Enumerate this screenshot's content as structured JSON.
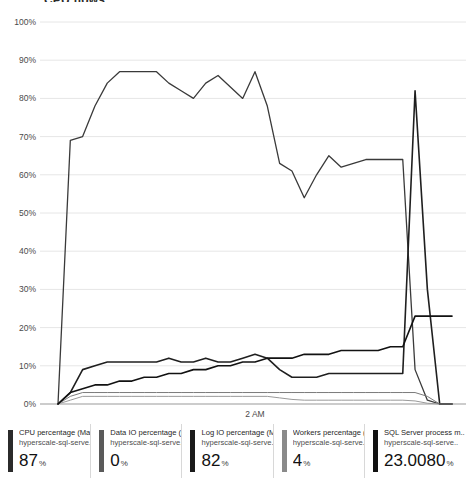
{
  "title": "CPU flows",
  "axis": {
    "yticks": [
      "100%",
      "90%",
      "80%",
      "70%",
      "60%",
      "50%",
      "40%",
      "30%",
      "20%",
      "10%",
      "0%"
    ],
    "xticks": [
      "2 AM"
    ]
  },
  "legend": {
    "items": [
      {
        "metric": "CPU percentage (Max)",
        "resource": "hyperscale-sql-serve..",
        "value": "87",
        "unit": "%",
        "color": "#2b2b2b"
      },
      {
        "metric": "Data IO percentage (..",
        "resource": "hyperscale-sql-serve..",
        "value": "0",
        "unit": "%",
        "color": "#5a5a5a"
      },
      {
        "metric": "Log IO percentage (Max)",
        "resource": "hyperscale-sql-serve..",
        "value": "82",
        "unit": "%",
        "color": "#1a1a1a"
      },
      {
        "metric": "Workers percentage (..",
        "resource": "hyperscale-sql-serve..",
        "value": "4",
        "unit": "%",
        "color": "#8a8a8a"
      },
      {
        "metric": "SQL Server process m..",
        "resource": "hyperscale-sql-serve..",
        "value": "23.0080",
        "unit": "%",
        "color": "#111111"
      }
    ]
  },
  "chart_data": {
    "type": "line",
    "title": "CPU flows",
    "xlabel": "",
    "ylabel": "",
    "ylim": [
      0,
      100
    ],
    "grid": true,
    "legend_position": "bottom",
    "x": [
      0,
      1,
      2,
      3,
      4,
      5,
      6,
      7,
      8,
      9,
      10,
      11,
      12,
      13,
      14,
      15,
      16,
      17,
      18,
      19,
      20,
      21,
      22,
      23,
      24,
      25,
      26,
      27,
      28,
      29,
      30,
      31,
      32
    ],
    "xtick_labels": {
      "16": "2 AM"
    },
    "series": [
      {
        "name": "CPU percentage (Max)",
        "color": "#3a3a3a",
        "width": 1.3,
        "values": [
          0,
          69,
          70,
          78,
          84,
          87,
          87,
          87,
          87,
          84,
          82,
          80,
          84,
          86,
          83,
          80,
          87,
          78,
          63,
          61,
          54,
          60,
          65,
          62,
          63,
          64,
          64,
          64,
          64,
          9,
          1,
          0,
          0
        ]
      },
      {
        "name": "Data IO percentage (..",
        "color": "#9a9a9a",
        "width": 1.0,
        "values": [
          0,
          1,
          2,
          2,
          2,
          2,
          2,
          2,
          2,
          2,
          2,
          2,
          2,
          2,
          2,
          2,
          2,
          2,
          1.6,
          1.2,
          1,
          1,
          1,
          1,
          1,
          1,
          1,
          1,
          1,
          0.8,
          0.2,
          0,
          0
        ]
      },
      {
        "name": "Log IO percentage (Max)",
        "color": "#1f1f1f",
        "width": 1.6,
        "values": [
          0,
          3,
          9,
          10,
          11,
          11,
          11,
          11,
          11,
          12,
          11,
          11,
          12,
          11,
          11,
          12,
          13,
          12,
          9,
          7,
          7,
          7,
          8,
          8,
          8,
          8,
          8,
          8,
          8,
          82,
          30,
          0,
          0
        ]
      },
      {
        "name": "Workers percentage (..",
        "color": "#7a7a7a",
        "width": 1.0,
        "values": [
          0,
          2,
          3,
          3,
          3,
          3,
          3,
          3,
          3,
          3,
          3,
          3,
          3,
          3,
          3,
          3,
          3,
          3,
          3,
          3,
          3,
          3,
          3,
          3,
          3,
          3,
          3,
          3,
          3,
          3,
          2,
          0,
          0
        ]
      },
      {
        "name": "SQL Server process m..",
        "color": "#121212",
        "width": 1.6,
        "values": [
          0,
          3,
          4,
          5,
          5,
          6,
          6,
          7,
          7,
          8,
          8,
          9,
          9,
          10,
          10,
          11,
          11,
          12,
          12,
          12,
          13,
          13,
          13,
          14,
          14,
          14,
          14,
          15,
          15,
          23,
          23,
          23,
          23
        ]
      }
    ]
  }
}
